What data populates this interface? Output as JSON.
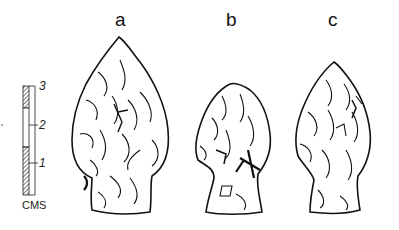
{
  "figure": {
    "labels": [
      {
        "id": "a",
        "text": "a"
      },
      {
        "id": "b",
        "text": "b"
      },
      {
        "id": "c",
        "text": "c"
      }
    ],
    "scale": {
      "ticks": [
        "3",
        "2",
        "1"
      ],
      "unit": "CMS"
    },
    "colors": {
      "ink": "#111111",
      "paper": "#ffffff"
    }
  }
}
